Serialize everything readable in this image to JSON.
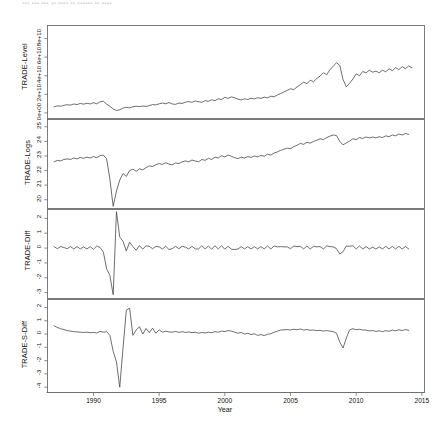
{
  "artifact": {
    "top_cut_text": "▪▪▪ ▪▪▪ ▪▪▪ ▪▪ ▪▪▪▪ ▪▪ ▪▪▪▪▪▪ ▪▪ ▪▪▪▪"
  },
  "figure": {
    "xlabel": "Year",
    "x_ticks": [
      "1990",
      "1995",
      "2000",
      "2005",
      "2010",
      "2015"
    ],
    "line_color": "#3d3d3d",
    "frame_color": "#6e6e6e",
    "background": "#ffffff"
  },
  "chart_data": [
    {
      "type": "line",
      "title": "",
      "ylabel": "TRADE-Level",
      "xlabel": "Year",
      "xlim": [
        1986.5,
        2015.2
      ],
      "ylim": [
        -6000000000.0,
        94000000000.0
      ],
      "y_ticks": [
        0,
        20000000000,
        40000000000,
        60000000000,
        80000000000
      ],
      "y_tick_labels": [
        "0e+00",
        "2e+10",
        "4e+10",
        "6e+10",
        "8e+10"
      ],
      "x_ticks": [
        1990,
        1995,
        2000,
        2005,
        2010,
        2015
      ],
      "grid": false,
      "legend": "none",
      "x": [
        1987.0,
        1987.25,
        1987.5,
        1987.75,
        1988.0,
        1988.25,
        1988.5,
        1988.75,
        1989.0,
        1989.25,
        1989.5,
        1989.75,
        1990.0,
        1990.25,
        1990.5,
        1990.75,
        1991.0,
        1991.25,
        1991.5,
        1991.75,
        1992.0,
        1992.25,
        1992.5,
        1992.75,
        1993.0,
        1993.25,
        1993.5,
        1993.75,
        1994.0,
        1994.25,
        1994.5,
        1994.75,
        1995.0,
        1995.25,
        1995.5,
        1995.75,
        1996.0,
        1996.25,
        1996.5,
        1996.75,
        1997.0,
        1997.25,
        1997.5,
        1997.75,
        1998.0,
        1998.25,
        1998.5,
        1998.75,
        1999.0,
        1999.25,
        1999.5,
        1999.75,
        2000.0,
        2000.25,
        2000.5,
        2000.75,
        2001.0,
        2001.25,
        2001.5,
        2001.75,
        2002.0,
        2002.25,
        2002.5,
        2002.75,
        2003.0,
        2003.25,
        2003.5,
        2003.75,
        2004.0,
        2004.25,
        2004.5,
        2004.75,
        2005.0,
        2005.25,
        2005.5,
        2005.75,
        2006.0,
        2006.25,
        2006.5,
        2006.75,
        2007.0,
        2007.25,
        2007.5,
        2007.75,
        2008.0,
        2008.25,
        2008.5,
        2008.75,
        2009.0,
        2009.25,
        2009.5,
        2009.75,
        2010.0,
        2010.25,
        2010.5,
        2010.75,
        2011.0,
        2011.25,
        2011.5,
        2011.75,
        2012.0,
        2012.25,
        2012.5,
        2012.75,
        2013.0,
        2013.25,
        2013.5,
        2013.75,
        2014.0,
        2014.25,
        2014.5,
        2014.75
      ],
      "values": [
        6500000000.0,
        7600000000.0,
        7200000000.0,
        8200000000.0,
        8800000000.0,
        8400000000.0,
        9600000000.0,
        9000000000.0,
        10200000000.0,
        9400000000.0,
        10400000000.0,
        9600000000.0,
        11000000000.0,
        9800000000.0,
        12000000000.0,
        12600000000.0,
        9400000000.0,
        7000000000.0,
        4400000000.0,
        2600000000.0,
        3400000000.0,
        5200000000.0,
        6000000000.0,
        5400000000.0,
        6600000000.0,
        7200000000.0,
        6800000000.0,
        7400000000.0,
        7000000000.0,
        7800000000.0,
        9000000000.0,
        8600000000.0,
        9800000000.0,
        10600000000.0,
        9800000000.0,
        11200000000.0,
        9600000000.0,
        9200000000.0,
        10600000000.0,
        10200000000.0,
        11600000000.0,
        12200000000.0,
        11400000000.0,
        12800000000.0,
        12000000000.0,
        11400000000.0,
        13200000000.0,
        12400000000.0,
        14200000000.0,
        13200000000.0,
        15200000000.0,
        14400000000.0,
        16800000000.0,
        15600000000.0,
        17200000000.0,
        16200000000.0,
        14800000000.0,
        14000000000.0,
        15200000000.0,
        14400000000.0,
        15800000000.0,
        15000000000.0,
        16400000000.0,
        15600000000.0,
        17000000000.0,
        16200000000.0,
        18000000000.0,
        17200000000.0,
        19400000000.0,
        20800000000.0,
        22600000000.0,
        24200000000.0,
        26000000000.0,
        25000000000.0,
        28000000000.0,
        30400000000.0,
        33000000000.0,
        31400000000.0,
        35200000000.0,
        33600000000.0,
        37000000000.0,
        39600000000.0,
        43200000000.0,
        41000000000.0,
        46400000000.0,
        50200000000.0,
        54000000000.0,
        51000000000.0,
        36000000000.0,
        28000000000.0,
        32000000000.0,
        36500000000.0,
        42000000000.0,
        40000000000.0,
        44600000000.0,
        43000000000.0,
        46000000000.0,
        43800000000.0,
        45000000000.0,
        43200000000.0,
        46000000000.0,
        44200000000.0,
        47400000000.0,
        45400000000.0,
        48600000000.0,
        46600000000.0,
        49800000000.0,
        47600000000.0,
        50600000000.0,
        48400000000.0
      ]
    },
    {
      "type": "line",
      "title": "",
      "ylabel": "TRADE-Logs",
      "xlabel": "Year",
      "xlim": [
        1986.5,
        2015.2
      ],
      "ylim": [
        19.4,
        25.5
      ],
      "y_ticks": [
        20,
        21,
        22,
        23,
        24,
        25
      ],
      "y_tick_labels": [
        "20",
        "21",
        "22",
        "23",
        "24",
        "25"
      ],
      "x_ticks": [
        1990,
        1995,
        2000,
        2005,
        2010,
        2015
      ],
      "grid": false,
      "legend": "none",
      "values": [
        22.6,
        22.7,
        22.66,
        22.76,
        22.8,
        22.76,
        22.86,
        22.8,
        22.9,
        22.84,
        22.92,
        22.86,
        22.96,
        22.88,
        23.02,
        23.06,
        22.8,
        21.4,
        19.55,
        20.6,
        21.35,
        21.8,
        21.6,
        22.0,
        22.1,
        21.95,
        22.12,
        22.05,
        22.2,
        22.32,
        22.28,
        22.4,
        22.48,
        22.42,
        22.54,
        22.44,
        22.4,
        22.52,
        22.48,
        22.6,
        22.66,
        22.6,
        22.72,
        22.66,
        22.6,
        22.76,
        22.7,
        22.84,
        22.76,
        22.92,
        22.86,
        23.02,
        22.94,
        23.06,
        22.98,
        22.88,
        22.82,
        22.92,
        22.86,
        22.96,
        22.9,
        23.0,
        22.94,
        23.04,
        22.98,
        23.12,
        23.06,
        23.2,
        23.28,
        23.38,
        23.46,
        23.54,
        23.5,
        23.64,
        23.74,
        23.86,
        23.8,
        23.94,
        23.88,
        24.0,
        24.08,
        24.18,
        24.12,
        24.26,
        24.36,
        24.44,
        24.4,
        24.0,
        23.76,
        23.9,
        24.02,
        24.18,
        24.12,
        24.26,
        24.2,
        24.3,
        24.24,
        24.3,
        24.24,
        24.32,
        24.26,
        24.38,
        24.32,
        24.44,
        24.38,
        24.5,
        24.44,
        24.54,
        24.48
      ]
    },
    {
      "type": "line",
      "title": "",
      "ylabel": "TRADE-Diff",
      "xlabel": "Year",
      "xlim": [
        1986.5,
        2015.2
      ],
      "ylim": [
        -3.4,
        2.6
      ],
      "y_ticks": [
        -3,
        -2,
        -1,
        0,
        1,
        2
      ],
      "y_tick_labels": [
        "-3",
        "-2",
        "-1",
        "0",
        "1",
        "2"
      ],
      "x_ticks": [
        1990,
        1995,
        2000,
        2005,
        2010,
        2015
      ],
      "grid": false,
      "legend": "none",
      "values": [
        0.1,
        -0.04,
        0.1,
        0.04,
        -0.04,
        0.1,
        -0.06,
        0.1,
        -0.06,
        0.08,
        -0.06,
        0.1,
        -0.08,
        0.14,
        0.04,
        -0.26,
        -1.4,
        -1.85,
        -3.15,
        2.45,
        0.75,
        0.45,
        -0.2,
        0.4,
        0.1,
        -0.15,
        0.17,
        -0.07,
        0.15,
        0.12,
        -0.04,
        0.12,
        0.08,
        -0.06,
        0.12,
        -0.1,
        -0.04,
        0.12,
        -0.04,
        0.12,
        0.06,
        -0.06,
        0.12,
        -0.06,
        -0.06,
        0.16,
        -0.06,
        0.14,
        -0.08,
        0.16,
        -0.06,
        0.16,
        -0.08,
        0.12,
        -0.08,
        -0.1,
        -0.06,
        0.1,
        -0.06,
        0.1,
        -0.06,
        0.1,
        -0.06,
        0.1,
        -0.06,
        0.14,
        -0.06,
        0.14,
        0.08,
        0.1,
        0.08,
        0.08,
        -0.04,
        0.14,
        0.1,
        0.12,
        -0.06,
        0.14,
        -0.06,
        0.12,
        0.08,
        0.1,
        -0.06,
        0.14,
        0.1,
        0.08,
        -0.04,
        -0.4,
        -0.24,
        0.14,
        0.12,
        0.16,
        -0.06,
        0.14,
        -0.06,
        0.1,
        -0.06,
        0.06,
        -0.06,
        0.08,
        -0.06,
        0.12,
        -0.06,
        0.12,
        -0.06,
        0.12,
        -0.06,
        0.1,
        -0.06
      ]
    },
    {
      "type": "line",
      "title": "",
      "ylabel": "TRADE-S-Diff",
      "xlabel": "Year",
      "xlim": [
        1986.5,
        2015.2
      ],
      "ylim": [
        -4.4,
        2.6
      ],
      "y_ticks": [
        -4,
        -3,
        -2,
        -1,
        0,
        1,
        2
      ],
      "y_tick_labels": [
        "-4",
        "-3",
        "-2",
        "-1",
        "0",
        "1",
        "2"
      ],
      "x_ticks": [
        1990,
        1995,
        2000,
        2005,
        2010,
        2015
      ],
      "grid": false,
      "legend": "none",
      "values": [
        0.62,
        0.5,
        0.4,
        0.34,
        0.26,
        0.22,
        0.18,
        0.16,
        0.14,
        0.12,
        0.14,
        0.1,
        0.12,
        0.08,
        0.2,
        0.14,
        0.18,
        -0.1,
        -1.3,
        -2.1,
        -4.0,
        -1.05,
        1.8,
        1.95,
        -0.1,
        0.3,
        0.55,
        0.0,
        0.42,
        0.1,
        0.44,
        0.06,
        0.32,
        0.14,
        0.22,
        0.16,
        0.14,
        0.2,
        0.12,
        0.18,
        0.12,
        0.16,
        0.1,
        0.14,
        0.06,
        0.12,
        0.08,
        0.14,
        0.1,
        0.18,
        0.14,
        0.22,
        0.18,
        0.26,
        0.22,
        0.14,
        0.06,
        0.12,
        0.0,
        0.06,
        -0.04,
        0.02,
        -0.1,
        -0.04,
        -0.12,
        -0.02,
        0.02,
        0.14,
        0.22,
        0.3,
        0.32,
        0.34,
        0.3,
        0.36,
        0.32,
        0.38,
        0.3,
        0.34,
        0.28,
        0.3,
        0.26,
        0.28,
        0.22,
        0.26,
        0.22,
        0.18,
        0.06,
        -0.6,
        -1.05,
        -0.3,
        0.32,
        0.4,
        0.32,
        0.36,
        0.3,
        0.3,
        0.24,
        0.26,
        0.2,
        0.24,
        0.18,
        0.26,
        0.2,
        0.3,
        0.24,
        0.32,
        0.26,
        0.34,
        0.28
      ]
    }
  ]
}
